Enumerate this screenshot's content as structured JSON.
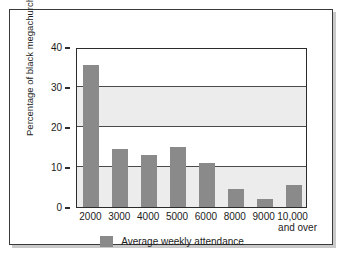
{
  "chart_data": {
    "type": "bar",
    "title": "",
    "xlabel": "",
    "ylabel": "Percentage of black megachurches",
    "categories": [
      "2000",
      "3000",
      "4000",
      "5000",
      "6000",
      "8000",
      "9000",
      "10,000"
    ],
    "category_sublabels": [
      "",
      "",
      "",
      "",
      "",
      "",
      "",
      "and over"
    ],
    "values": [
      35.5,
      14.5,
      13,
      15,
      11,
      4.5,
      2,
      5.5
    ],
    "ylim": [
      0,
      40
    ],
    "yticks": [
      0,
      10,
      20,
      30,
      40
    ],
    "ytick_labels": [
      "0",
      "10",
      "20",
      "30",
      "40"
    ],
    "grid": true,
    "legend": {
      "position": "bottom",
      "entries": [
        {
          "label": "Average weekly attendance",
          "color": "#8a8a8a"
        }
      ]
    },
    "series": [
      {
        "name": "Average weekly attendance",
        "color": "#8a8a8a",
        "values": [
          35.5,
          14.5,
          13,
          15,
          11,
          4.5,
          2,
          5.5
        ]
      }
    ],
    "bands": [
      {
        "from": 0,
        "to": 10,
        "color": "#ececec"
      },
      {
        "from": 10,
        "to": 20,
        "color": "#ffffff"
      },
      {
        "from": 20,
        "to": 30,
        "color": "#ececec"
      },
      {
        "from": 30,
        "to": 40,
        "color": "#ffffff"
      }
    ]
  },
  "colors": {
    "bar": "#8a8a8a",
    "band": "#ececec",
    "axis": "#2b2b2b",
    "frame": "#3a3a3a",
    "text": "#1c1c1c",
    "shadow": "#c9c9c9",
    "background": "#ffffff"
  }
}
